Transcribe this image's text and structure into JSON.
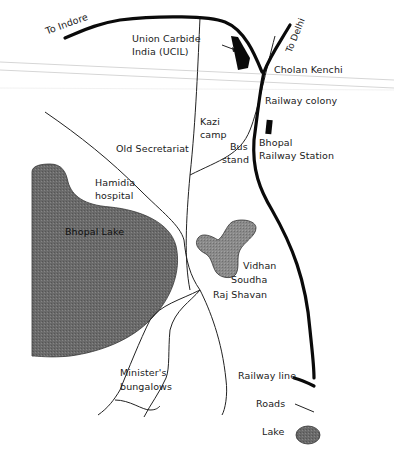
{
  "map": {
    "title": "Bhopal city map",
    "colors": {
      "background": "#ffffff",
      "railway": "#0a0a0a",
      "road": "#222222",
      "lake_fill": "#6e6e6e",
      "building": "#0a0a0a",
      "scan_band": "#d8d8d8"
    },
    "labels": {
      "to_indore": "To Indore",
      "to_delhi": "To Delhi",
      "ucil_line1": "Union Carbide",
      "ucil_line2": "India (UCIL)",
      "cholan_kenchi": "Cholan Kenchi",
      "railway_colony": "Railway colony",
      "kazi_camp_line1": "Kazi",
      "kazi_camp_line2": "camp",
      "bus_stand_line1": "Bus",
      "bus_stand_line2": "stand",
      "bhopal_station_line1": "Bhopal",
      "bhopal_station_line2": "Railway Station",
      "old_secretariat": "Old Secretariat",
      "hamidia_line1": "Hamidia",
      "hamidia_line2": "hospital",
      "bhopal_lake": "Bhopal Lake",
      "vidhan_line1": "Vidhan",
      "vidhan_line2": "Soudha",
      "raj_bhavan": "Raj Shavan",
      "ministers_line1": "Minister's",
      "ministers_line2": "bungalows"
    },
    "legend": {
      "items": [
        {
          "label": "Railway line",
          "symbol": "thick-line"
        },
        {
          "label": "Roads",
          "symbol": "thin-line"
        },
        {
          "label": "Lake",
          "symbol": "shaded-blob"
        }
      ]
    }
  }
}
